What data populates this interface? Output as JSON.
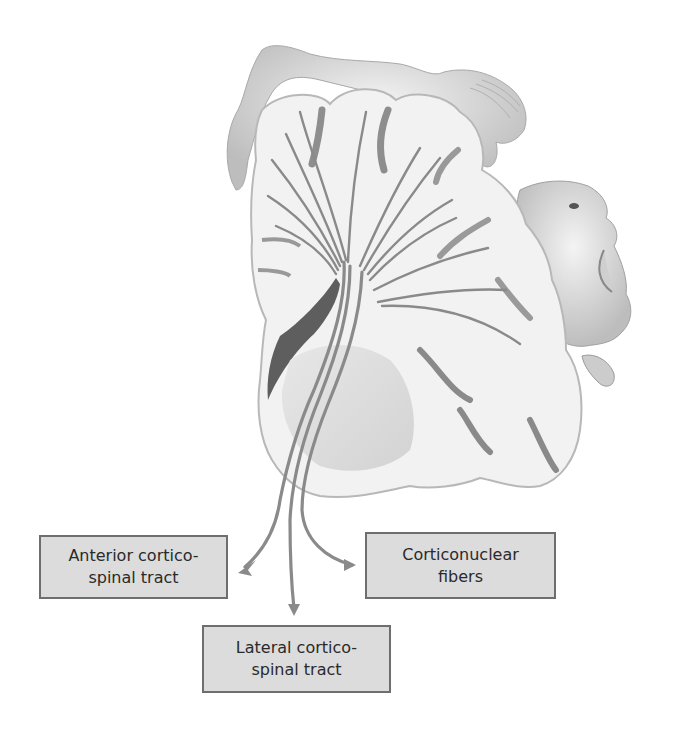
{
  "figure": {
    "colors": {
      "background": "#ffffff",
      "label_fill": "#dcdcdc",
      "label_border": "#6e6e6e",
      "tract_color": "#8a8a8a",
      "text": "#2a2a2a"
    }
  },
  "labels": {
    "anterior": {
      "line1": "Anterior cortico-",
      "line2": "spinal tract"
    },
    "corticonuclear": {
      "line1": "Corticonuclear",
      "line2": "fibers"
    },
    "lateral": {
      "line1": "Lateral cortico-",
      "line2": "spinal tract"
    }
  },
  "illustration": {
    "elements": [
      "brain-coronal-section",
      "homunculus-leg-foot",
      "homunculus-face",
      "homunculus-tongue",
      "tract-fibers",
      "arrow-anterior",
      "arrow-lateral",
      "arrow-corticonuclear"
    ]
  }
}
